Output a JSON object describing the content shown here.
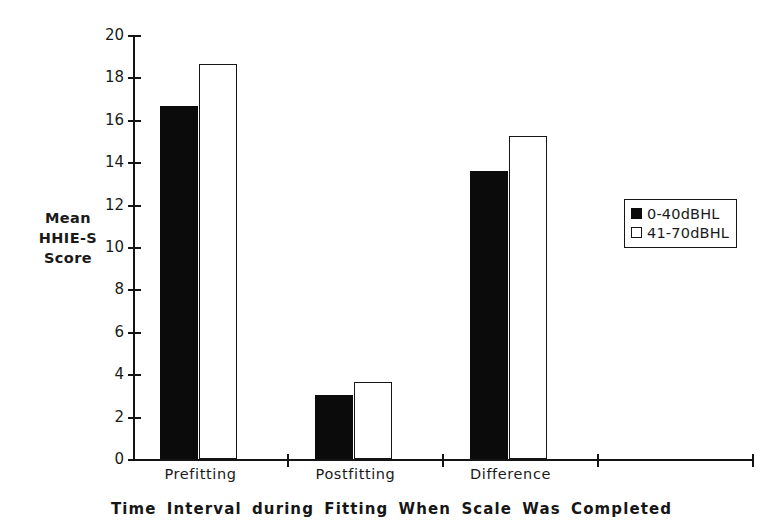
{
  "chart_data": {
    "type": "bar",
    "title": "",
    "subtitle": "",
    "xlabel": "Time Interval during Fitting When Scale Was Completed",
    "ylabel": "Mean HHIE-S Score",
    "ylabel_lines": [
      "Mean",
      "HHIE-S",
      "Score"
    ],
    "categories": [
      "Prefitting",
      "Postfitting",
      "Difference"
    ],
    "series": [
      {
        "name": "0-40dBHL",
        "values": [
          16.65,
          3.0,
          13.6
        ],
        "color": "#0b0b0b",
        "fill": "solid"
      },
      {
        "name": "41-70dBHL",
        "values": [
          18.65,
          3.65,
          15.25
        ],
        "color": "#ffffff",
        "fill": "hollow"
      }
    ],
    "ylim": [
      0,
      20
    ],
    "yticks": [
      0,
      2,
      4,
      6,
      8,
      10,
      12,
      14,
      16,
      18,
      20
    ],
    "ytick_labels": [
      "0",
      "2",
      "4",
      "6",
      "8",
      "10",
      "12",
      "14",
      "16",
      "18",
      "20"
    ],
    "grid": false,
    "legend_position": "right",
    "empty_category_slots": 1
  },
  "legend": {
    "entries": [
      {
        "label": "0-40dBHL",
        "swatch": "filled-square-icon"
      },
      {
        "label": "41-70dBHL",
        "swatch": "hollow-square-icon"
      }
    ]
  }
}
